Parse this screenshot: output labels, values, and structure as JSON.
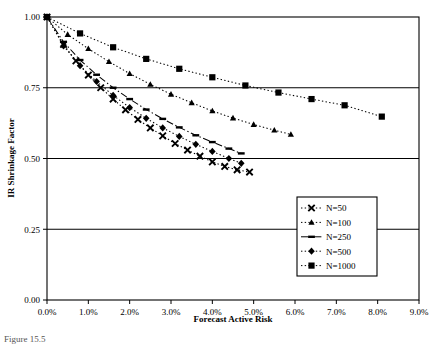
{
  "figure": {
    "caption": "Figure 15.5"
  },
  "chart_data": {
    "type": "line",
    "title": "",
    "subtitle": "",
    "xlabel": "Forecast Active Risk",
    "ylabel": "IR Shrinkage Factor",
    "xlim": [
      0,
      9
    ],
    "ylim": [
      0,
      1
    ],
    "xticks": [
      0,
      1,
      2,
      3,
      4,
      5,
      6,
      7,
      8,
      9
    ],
    "xtick_labels": [
      "0.0%",
      "1.0%",
      "2.0%",
      "3.0%",
      "4.0%",
      "5.0%",
      "6.0%",
      "7.0%",
      "8.0%",
      "9.0%"
    ],
    "yticks": [
      0,
      0.25,
      0.5,
      0.75,
      1.0
    ],
    "ytick_labels": [
      "0.00",
      "0.25",
      "0.50",
      "0.75",
      "1.00"
    ],
    "grid": "horizontal",
    "legend_position": "right-middle",
    "series": [
      {
        "name": "N=50",
        "marker": "x",
        "linestyle": "dotted",
        "color": "#000000",
        "points": [
          [
            0.0,
            1.0
          ],
          [
            0.4,
            0.903
          ],
          [
            0.7,
            0.845
          ],
          [
            1.0,
            0.795
          ],
          [
            1.3,
            0.75
          ],
          [
            1.6,
            0.71
          ],
          [
            1.9,
            0.672
          ],
          [
            2.2,
            0.638
          ],
          [
            2.5,
            0.608
          ],
          [
            2.8,
            0.58
          ],
          [
            3.1,
            0.553
          ],
          [
            3.4,
            0.53
          ],
          [
            3.7,
            0.508
          ],
          [
            4.0,
            0.488
          ],
          [
            4.3,
            0.472
          ],
          [
            4.6,
            0.46
          ],
          [
            4.9,
            0.452
          ]
        ]
      },
      {
        "name": "N=100",
        "marker": "triangle",
        "linestyle": "dotted",
        "color": "#000000",
        "points": [
          [
            0.0,
            1.0
          ],
          [
            0.5,
            0.938
          ],
          [
            1.0,
            0.888
          ],
          [
            1.5,
            0.842
          ],
          [
            2.0,
            0.8
          ],
          [
            2.5,
            0.762
          ],
          [
            3.0,
            0.727
          ],
          [
            3.5,
            0.697
          ],
          [
            4.0,
            0.668
          ],
          [
            4.5,
            0.643
          ],
          [
            5.0,
            0.62
          ],
          [
            5.5,
            0.6
          ],
          [
            5.9,
            0.585
          ]
        ]
      },
      {
        "name": "N=250",
        "marker": "dash",
        "linestyle": "dash-dot",
        "color": "#000000",
        "points": [
          [
            0.0,
            1.0
          ],
          [
            0.4,
            0.912
          ],
          [
            0.8,
            0.848
          ],
          [
            1.2,
            0.796
          ],
          [
            1.6,
            0.75
          ],
          [
            2.0,
            0.71
          ],
          [
            2.4,
            0.673
          ],
          [
            2.8,
            0.64
          ],
          [
            3.2,
            0.61
          ],
          [
            3.6,
            0.582
          ],
          [
            4.0,
            0.558
          ],
          [
            4.4,
            0.535
          ],
          [
            4.7,
            0.518
          ]
        ]
      },
      {
        "name": "N=500",
        "marker": "diamond",
        "linestyle": "dotted",
        "color": "#000000",
        "points": [
          [
            0.0,
            1.0
          ],
          [
            0.4,
            0.898
          ],
          [
            0.8,
            0.828
          ],
          [
            1.2,
            0.772
          ],
          [
            1.6,
            0.723
          ],
          [
            2.0,
            0.68
          ],
          [
            2.4,
            0.642
          ],
          [
            2.8,
            0.608
          ],
          [
            3.2,
            0.578
          ],
          [
            3.6,
            0.55
          ],
          [
            4.0,
            0.525
          ],
          [
            4.4,
            0.5
          ],
          [
            4.7,
            0.483
          ]
        ]
      },
      {
        "name": "N=1000",
        "marker": "square",
        "linestyle": "dotted",
        "color": "#000000",
        "points": [
          [
            0.0,
            1.0
          ],
          [
            0.8,
            0.942
          ],
          [
            1.6,
            0.893
          ],
          [
            2.4,
            0.852
          ],
          [
            3.2,
            0.817
          ],
          [
            4.0,
            0.787
          ],
          [
            4.8,
            0.758
          ],
          [
            5.6,
            0.733
          ],
          [
            6.4,
            0.71
          ],
          [
            7.2,
            0.688
          ],
          [
            8.1,
            0.648
          ]
        ]
      }
    ]
  },
  "legend": {
    "items": [
      {
        "label": "N=50",
        "marker": "square"
      },
      {
        "label": "N=100",
        "marker": "triangle"
      },
      {
        "label": "N=250",
        "marker": "dash"
      },
      {
        "label": "N=500",
        "marker": "diamond"
      },
      {
        "label": "N=1000",
        "marker": "square"
      }
    ]
  }
}
